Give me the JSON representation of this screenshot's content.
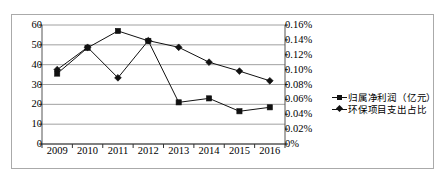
{
  "chart_data": {
    "type": "line",
    "title": "",
    "xlabel": "",
    "categories": [
      "2009",
      "2010",
      "2011",
      "2012",
      "2013",
      "2014",
      "2015",
      "2016"
    ],
    "grid": true,
    "legend_position": "right",
    "axes": {
      "left": {
        "label": "",
        "ylim": [
          0,
          60
        ],
        "ticks": [
          "0",
          "10",
          "20",
          "30",
          "40",
          "50",
          "60"
        ],
        "tick_values": [
          0,
          10,
          20,
          30,
          40,
          50,
          60
        ]
      },
      "right": {
        "label": "",
        "ylim": [
          0,
          0.0016
        ],
        "ticks": [
          "0%",
          "0.02%",
          "0.04%",
          "0.06%",
          "0.08%",
          "0.10%",
          "0.12%",
          "0.14%",
          "0.16%"
        ],
        "tick_values": [
          0,
          0.0002,
          0.0004,
          0.0006,
          0.0008,
          0.001,
          0.0012,
          0.0014,
          0.0016
        ]
      }
    },
    "series": [
      {
        "name": "归属净利润（亿元）",
        "marker": "square",
        "axis": "left",
        "color": "#111111",
        "values": [
          35.5,
          48.5,
          57.0,
          52.0,
          21.0,
          23.0,
          16.5,
          18.5
        ]
      },
      {
        "name": "环保项目支出占比",
        "marker": "diamond",
        "axis": "right",
        "color": "#111111",
        "values": [
          0.1,
          0.13,
          0.089,
          0.139,
          0.13,
          0.11,
          0.098,
          0.085
        ],
        "value_unit": "%"
      }
    ]
  },
  "legend": {
    "items": [
      {
        "label": "归属净利润（亿元）",
        "marker": "square-marker-icon"
      },
      {
        "label": "环保项目支出占比",
        "marker": "diamond-marker-icon"
      }
    ]
  }
}
